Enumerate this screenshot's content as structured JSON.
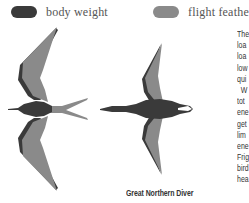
{
  "legend": {
    "items": [
      {
        "label": "body weight",
        "color": "#3a3a3a"
      },
      {
        "label": "flight feathers",
        "color": "#8a8a8a"
      }
    ]
  },
  "figures": [
    {
      "name": "frigatebird-silhouette",
      "caption": ""
    },
    {
      "name": "great-northern-diver-silhouette",
      "caption": "Great Northern Diver"
    }
  ],
  "side_text_fragments": [
    "The",
    "loa",
    "loa",
    "low",
    "qui",
    "  W",
    "tot",
    "ene",
    "get",
    "lim",
    "ene",
    "Frig",
    "bird",
    "hea"
  ],
  "colors": {
    "body": "#3a3a3a",
    "feathers": "#8a8a8a",
    "text": "#333333"
  }
}
